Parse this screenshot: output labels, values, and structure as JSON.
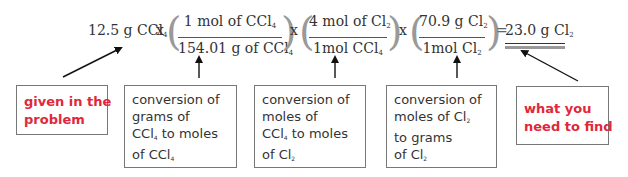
{
  "equation": {
    "given": {
      "value": "12.5 g CCl",
      "sub": "4"
    },
    "times": "x",
    "equals": "=",
    "fractions": [
      {
        "numerator": {
          "text": "1 mol of CCl",
          "sub": "4"
        },
        "denominator": {
          "text": "154.01 g of CCl",
          "sub": "4"
        }
      },
      {
        "numerator": {
          "text": "4 mol of Cl",
          "sub": "2"
        },
        "denominator": {
          "text": "1mol CCl",
          "sub": "4"
        }
      },
      {
        "numerator": {
          "text": "70.9 g Cl",
          "sub": "2"
        },
        "denominator": {
          "text": "1mol Cl",
          "sub": "2"
        }
      }
    ],
    "answer": {
      "value": "23.0 g Cl",
      "sub": "2"
    },
    "paren_open": "(",
    "paren_close": ")"
  },
  "boxes": [
    {
      "id": "given",
      "color": "#e0283a",
      "lines": [
        {
          "text": "given in the"
        },
        {
          "text": "problem"
        }
      ]
    },
    {
      "id": "grams-to-moles",
      "lines": [
        {
          "text": "conversion of"
        },
        {
          "text": "grams of"
        },
        {
          "text": "CCl",
          "sub": "4",
          "after": " to moles"
        },
        {
          "text": "of CCl",
          "sub": "4"
        }
      ]
    },
    {
      "id": "moles-to-moles",
      "lines": [
        {
          "text": "conversion of"
        },
        {
          "text": "moles of"
        },
        {
          "text": "CCl",
          "sub": "4",
          "after": " to moles"
        },
        {
          "text": "of Cl",
          "sub": "2"
        }
      ]
    },
    {
      "id": "moles-to-grams",
      "lines": [
        {
          "text": "conversion of"
        },
        {
          "text": "moles of Cl",
          "sub": "2"
        },
        {
          "text": "to grams"
        },
        {
          "text": "of Cl",
          "sub": "2"
        }
      ]
    },
    {
      "id": "find",
      "color": "#e0283a",
      "lines": [
        {
          "text": "what you"
        },
        {
          "text": "need to find"
        }
      ]
    }
  ],
  "colors": {
    "highlight_red": "#e0283a",
    "text": "#333333",
    "border": "#777777",
    "arrow": "#111111"
  }
}
